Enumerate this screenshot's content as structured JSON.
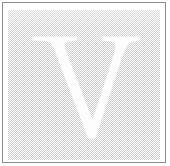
{
  "figure": {
    "name": "drop-cap-plate",
    "letter": "V",
    "letter_style": "serif-roman-capital",
    "letter_color": "#fdfdfd",
    "tint_color": "#c9c9c9",
    "tint_appearance": "50-percent-dither",
    "background_color": "#ffffff",
    "border_color": "#8d8d8d",
    "border_width_px": 1,
    "width_px": 170,
    "height_px": 166,
    "tint_bounds": {
      "x": 8,
      "y": 10,
      "width": 152,
      "height": 150
    },
    "letter_bounds": {
      "x": 32,
      "y": 36,
      "width": 108,
      "height": 103
    }
  }
}
